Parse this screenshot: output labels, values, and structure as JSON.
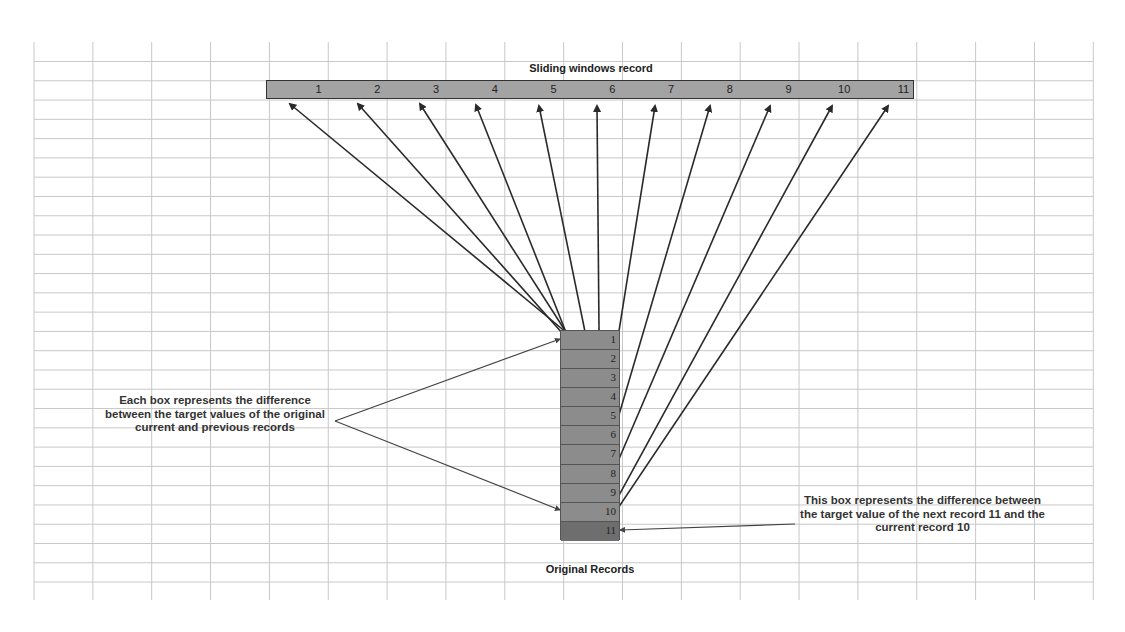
{
  "sliding_window": {
    "title": "Sliding windows record",
    "cells": [
      "1",
      "2",
      "3",
      "4",
      "5",
      "6",
      "7",
      "8",
      "9",
      "10",
      "11"
    ]
  },
  "original_records": {
    "label": "Original Records",
    "rows": [
      "1",
      "2",
      "3",
      "4",
      "5",
      "6",
      "7",
      "8",
      "9",
      "10",
      "11"
    ],
    "highlighted_row": "11"
  },
  "annotations": {
    "left_note": "Each box represents  the difference between the target values of the original current and previous records",
    "right_note": "This box represents the difference between the target value of the next record 11 and the current record 10"
  },
  "colors": {
    "bar_fill": "#a3a3a3",
    "record_fill": "#8c8c8c",
    "next_record_fill": "#6e6e6e",
    "grid_line": "#c8c8c8",
    "arrow": "#2a2a2a"
  }
}
